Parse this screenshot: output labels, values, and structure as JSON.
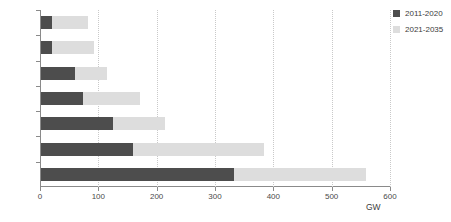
{
  "chart_data": {
    "type": "bar",
    "orientation": "horizontal",
    "stacked": true,
    "title": "",
    "subtitle": "",
    "xlabel": "GW",
    "ylabel": "",
    "xlim": [
      0,
      600
    ],
    "xticks": [
      0,
      100,
      200,
      300,
      400,
      500,
      600
    ],
    "xtick_labels": [
      "0",
      "100",
      "200",
      "300",
      "400",
      "500",
      "600"
    ],
    "grid": "vertical-dotted",
    "legend_position": "top-right",
    "categories": [
      "Coal",
      "Wind",
      "Hydro",
      "Gas",
      "Nuclear",
      "Solar PV",
      "Other"
    ],
    "series": [
      {
        "name": "2011-2020",
        "color": "#4d4d4d",
        "values": [
          331,
          158,
          123,
          72,
          59,
          18,
          19
        ]
      },
      {
        "name": "2021-2035",
        "color": "#dddddd",
        "values": [
          226,
          224,
          89,
          98,
          54,
          72,
          61
        ]
      }
    ],
    "totals": [
      557,
      382,
      212,
      170,
      113,
      90,
      80
    ]
  },
  "legend": {
    "items": [
      {
        "label": "2011-2020",
        "color": "#4d4d4d"
      },
      {
        "label": "2021-2035",
        "color": "#dddddd"
      }
    ]
  },
  "axis": {
    "x_title": "GW"
  }
}
